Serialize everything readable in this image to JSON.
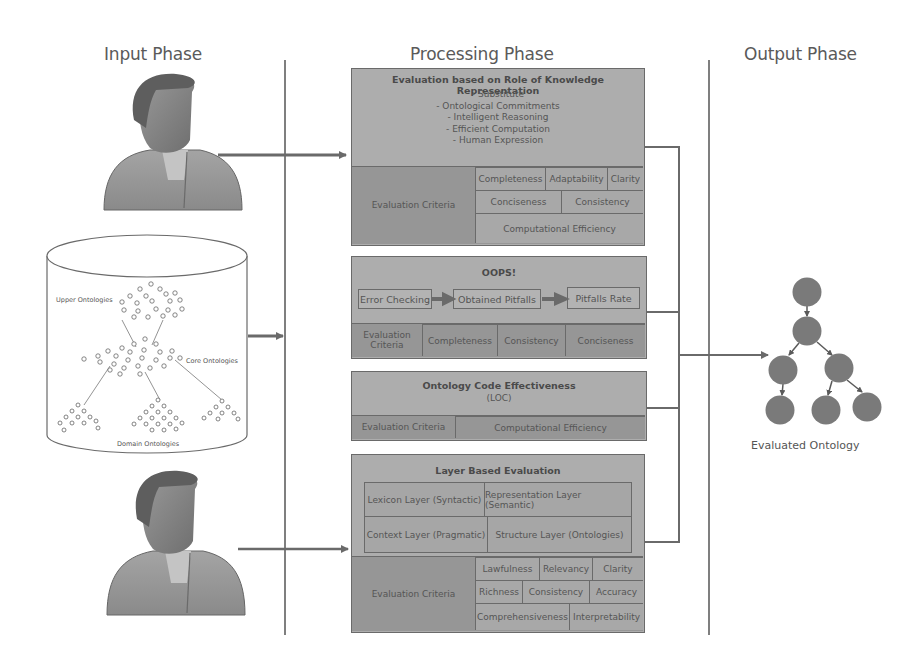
{
  "phases": {
    "input": "Input Phase",
    "processing": "Processing Phase",
    "output": "Output Phase"
  },
  "input": {
    "users": [
      {
        "icon": "user-avatar-icon"
      },
      {
        "icon": "user-avatar-icon"
      }
    ],
    "database": {
      "icon": "database-cylinder-icon",
      "labels": {
        "upper": "Upper Ontologies",
        "core": "Core Ontologies",
        "domain": "Domain Ontologies"
      }
    }
  },
  "processing": {
    "knowledge_representation": {
      "title": "Evaluation based on Role of Knowledge Representation",
      "roles": [
        "- Substitute",
        "- Ontological Commitments",
        "- Intelligent Reasoning",
        "- Efficient Computation",
        "- Human Expression"
      ],
      "criteria_label": "Evaluation Criteria",
      "criteria": {
        "row1": [
          "Completeness",
          "Adaptability",
          "Clarity"
        ],
        "row2": [
          "Conciseness",
          "Consistency"
        ],
        "row3": [
          "Computational Efficiency"
        ]
      }
    },
    "oops": {
      "title": "OOPS!",
      "flow": [
        "Error Checking",
        "Obtained Pitfalls",
        "Pitfalls Rate"
      ],
      "criteria_label": "Evaluation Criteria",
      "criteria": [
        "Completeness",
        "Consistency",
        "Conciseness"
      ]
    },
    "code_effectiveness": {
      "title": "Ontology Code Effectiveness",
      "subtitle": "(LOC)",
      "criteria_label": "Evaluation Criteria",
      "criteria": [
        "Computational Efficiency"
      ]
    },
    "layer_based": {
      "title": "Layer Based Evaluation",
      "layers": {
        "row1": [
          "Lexicon Layer (Syntactic)",
          "Representation Layer (Semantic)"
        ],
        "row2": [
          "Context Layer (Pragmatic)",
          "Structure Layer (Ontologies)"
        ]
      },
      "criteria_label": "Evaluation Criteria",
      "criteria": {
        "row1": [
          "Lawfulness",
          "Relevancy",
          "Clarity"
        ],
        "row2": [
          "Richness",
          "Consistency",
          "Accuracy"
        ],
        "row3": [
          "Comprehensiveness",
          "Interpretability"
        ]
      }
    }
  },
  "output": {
    "label": "Evaluated Ontology",
    "icon": "ontology-tree-icon"
  },
  "colors": {
    "box_fill": "#adadad",
    "criteria_fill": "#969696",
    "line": "#6a6a6a",
    "node": "#7a7a7a"
  }
}
